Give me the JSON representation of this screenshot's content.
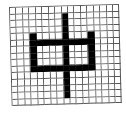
{
  "glyph": {
    "character": "中",
    "grid": {
      "columns": 17,
      "rows": 15
    },
    "colors": {
      "filled": "#000000",
      "empty": "#ffffff",
      "gridline": "#555555"
    },
    "filled_cells": {
      "stem": {
        "col": 8,
        "row_start": 1,
        "row_end": 13
      },
      "left_vertical": {
        "col": 3,
        "row_start": 4,
        "row_end": 9
      },
      "right_vertical": {
        "col": 12,
        "row_start": 4,
        "row_end": 9
      },
      "top_bar": {
        "row": 5,
        "col_start": 3,
        "col_end": 12
      },
      "bottom_bar": {
        "row": 9,
        "col_start": 3,
        "col_end": 12
      }
    }
  }
}
